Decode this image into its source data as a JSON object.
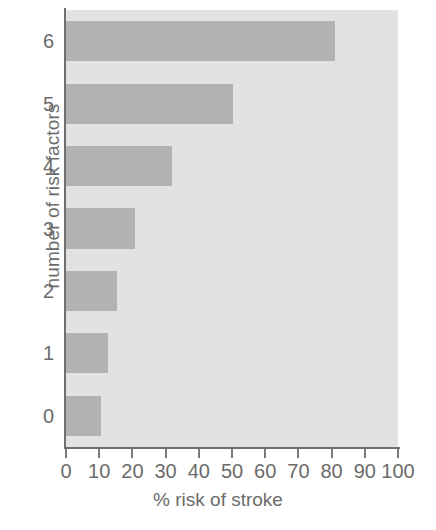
{
  "chart_data": {
    "type": "bar",
    "orientation": "horizontal",
    "title": "",
    "xlabel": "% risk of stroke",
    "ylabel": "number of risk factors",
    "categories": [
      "0",
      "1",
      "2",
      "3",
      "4",
      "5",
      "6"
    ],
    "values": [
      10.5,
      12.7,
      15.4,
      20.8,
      32,
      50.3,
      81
    ],
    "xlim": [
      0,
      100
    ],
    "xticks": [
      "0",
      "10",
      "20",
      "30",
      "40",
      "50",
      "60",
      "70",
      "80",
      "90",
      "100"
    ],
    "xtick_values": [
      0,
      10,
      20,
      30,
      40,
      50,
      60,
      70,
      80,
      90,
      100
    ],
    "yticks": [
      "0",
      "1",
      "2",
      "3",
      "4",
      "5",
      "6"
    ],
    "grid": false,
    "legend": null,
    "colors": {
      "bar_fill": "#b2b2b2",
      "plot_background": "#e2e2e2",
      "axis": "#6f6f6f",
      "text": "#6b6b6b",
      "figure_background": "#ffffff"
    }
  }
}
